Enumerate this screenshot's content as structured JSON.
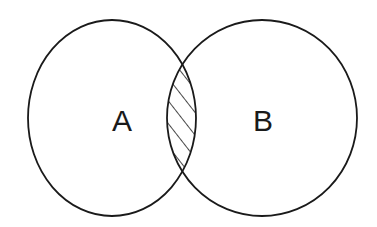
{
  "diagram": {
    "type": "venn",
    "sets": [
      {
        "id": "A",
        "label": "A"
      },
      {
        "id": "B",
        "label": "B"
      }
    ],
    "highlighted_region": "A ∩ B",
    "highlight_style": "diagonal-hatch",
    "colors": {
      "stroke": "#1a1a1a",
      "background": "#ffffff"
    }
  }
}
